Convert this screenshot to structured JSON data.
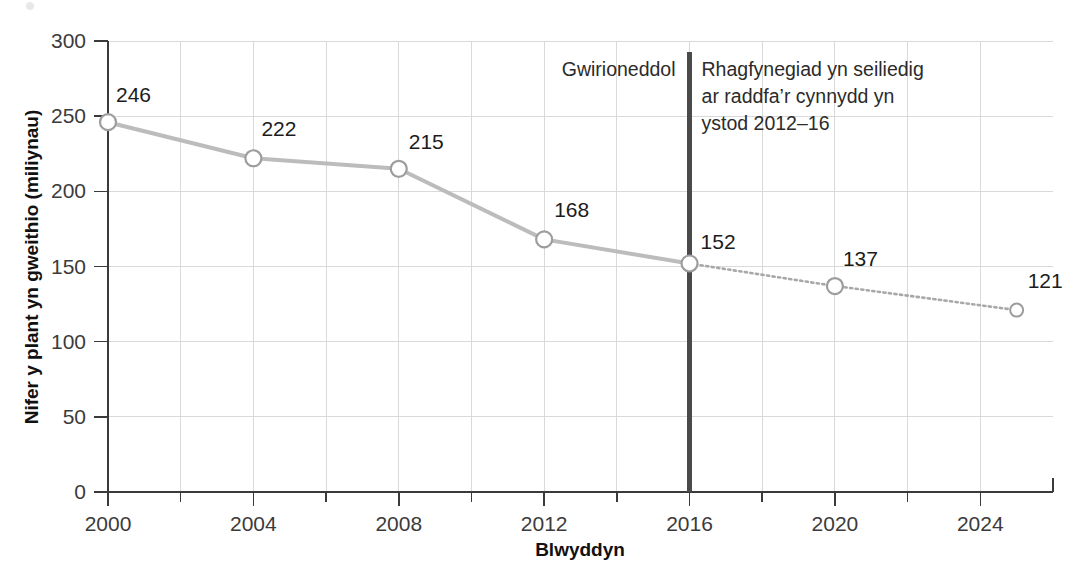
{
  "chart_data": {
    "type": "line",
    "title": "",
    "xlabel": "Blwyddyn",
    "ylabel": "Nifer y plant yn gweithio (miliynau)",
    "xlim": [
      2000,
      2026
    ],
    "ylim": [
      0,
      300
    ],
    "grid": true,
    "legend": "none",
    "x": [
      2000,
      2004,
      2008,
      2012,
      2016,
      2020,
      2025
    ],
    "values": [
      246,
      222,
      215,
      168,
      152,
      137,
      121
    ],
    "series": [
      {
        "name": "Gwirioneddol",
        "style": "solid",
        "x": [
          2000,
          2004,
          2008,
          2012,
          2016
        ],
        "values": [
          246,
          222,
          215,
          168,
          152
        ]
      },
      {
        "name": "Rhagfynegiad",
        "style": "dotted",
        "x": [
          2016,
          2020,
          2025
        ],
        "values": [
          152,
          137,
          121
        ]
      }
    ],
    "point_labels": [
      "246",
      "222",
      "215",
      "168",
      "152",
      "137",
      "121"
    ],
    "ytick_labels": [
      "0",
      "50",
      "100",
      "150",
      "200",
      "250",
      "300"
    ],
    "ytick_values": [
      0,
      50,
      100,
      150,
      200,
      250,
      300
    ],
    "xtick_labels": [
      "2000",
      "2004",
      "2008",
      "2012",
      "2016",
      "2020",
      "2024"
    ],
    "xtick_values": [
      2000,
      2004,
      2008,
      2012,
      2016,
      2020,
      2024
    ],
    "annotations": [
      {
        "name": "actual-label",
        "text": "Gwirioneddol",
        "lines": [
          "Gwirioneddol"
        ]
      },
      {
        "name": "forecast-label",
        "text": "Rhagfynegiad yn seiliedig ar raddfa'r cynnydd yn ystod 2012–16",
        "lines": [
          "Rhagfynegiad yn seiliedig",
          "ar raddfa’r cynnydd yn",
          "ystod 2012–16"
        ]
      }
    ],
    "divider": {
      "name": "forecast-divider",
      "at_x": 2016,
      "color": "#4a4a4a"
    },
    "colors": {
      "line_actual": "#bcbcbc",
      "line_forecast": "#a8a8a8",
      "marker_fill": "#ffffff",
      "marker_stroke": "#9d9d9d",
      "grid": "#d9d9d9",
      "axis": "#3a3a3a",
      "text": "#231f20",
      "divider": "#4a4a4a"
    }
  }
}
